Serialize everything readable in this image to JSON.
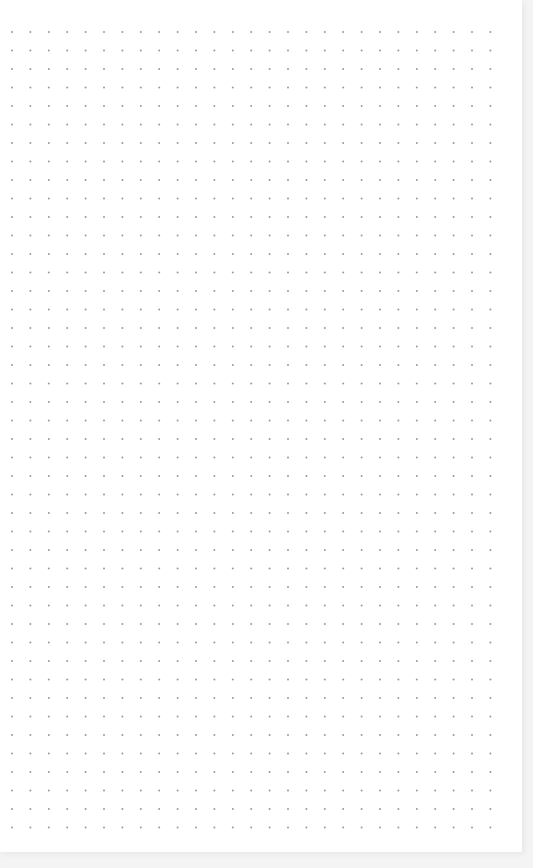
{
  "page": {
    "type": "dot-grid-paper",
    "background_color": "#ffffff",
    "outer_color": "#f4f4f4"
  },
  "grid": {
    "columns": 27,
    "rows": 44,
    "origin_x": 12,
    "origin_y": 32,
    "spacing_x": 18.4,
    "spacing_y": 18.5,
    "dot_radius": 1,
    "dot_color": "#9a9a9a"
  }
}
